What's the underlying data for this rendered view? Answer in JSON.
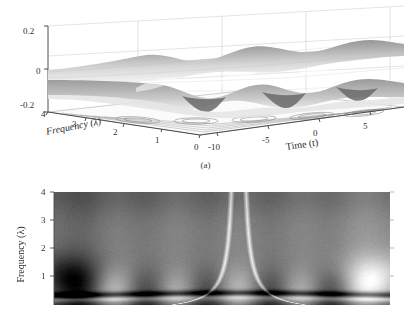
{
  "figure": {
    "background_color": "#ffffff",
    "text_color": "#2b2b2b"
  },
  "panel_a": {
    "subcaption": "(a)",
    "z_axis": {
      "ticks": [
        "0.2",
        "0",
        "-0.2"
      ]
    },
    "frequency_axis": {
      "title": "Frequency (λ)",
      "ticks": [
        "4",
        "3",
        "2",
        "1",
        "0"
      ]
    },
    "time_axis": {
      "title": "Time (t)",
      "ticks": [
        "-10",
        "-5",
        "0",
        "5"
      ]
    }
  },
  "panel_b": {
    "frequency_axis": {
      "title": "Frequency (λ)",
      "ticks": [
        "4",
        "3",
        "2",
        "1"
      ]
    }
  },
  "chart_data": [
    {
      "type": "surface",
      "panel": "(a)",
      "title": "",
      "xlabel": "Time (t)",
      "ylabel": "Frequency (λ)",
      "zlabel": "",
      "xlim": [
        -13,
        7
      ],
      "ylim": [
        0,
        4
      ],
      "zlim": [
        -0.2,
        0.2
      ],
      "xticks": [
        -10,
        -5,
        0,
        5
      ],
      "yticks": [
        0,
        1,
        2,
        3,
        4
      ],
      "zticks": [
        -0.2,
        0,
        0.2
      ],
      "grid": true,
      "colormap": "gray",
      "description": "Wigner-Ville / wavelet time-frequency surface with oscillating ridges along time and a base-plane contour projection",
      "surface_model": {
        "form": "z = A*exp(-((y-y0)^2)/(2*sy^2)) * cos(w*(x-x0)) * exp(-((x-xc)^2)/(2*sx^2)) + ripple",
        "amplitude": 0.15,
        "ridge_frequency_center": 1.0,
        "ridge_sigma_freq": 0.55,
        "oscillation_period_time": 4.0,
        "envelope_center_time": -3.0,
        "envelope_sigma_time": 7.0
      },
      "ridge_peaks_time": [
        -10.0,
        -6.0,
        -2.0,
        2.0,
        6.0
      ],
      "ridge_troughs_time": [
        -12.0,
        -8.0,
        -4.0,
        0.0,
        4.0
      ],
      "view": {
        "azimuth": -37.5,
        "elevation": 18
      }
    },
    {
      "type": "heatmap",
      "panel": "(b)",
      "title": "",
      "xlabel": "",
      "ylabel": "Frequency (λ)",
      "xlim": [
        -13,
        7
      ],
      "ylim": [
        0.3,
        4
      ],
      "yticks": [
        1,
        2,
        3,
        4
      ],
      "grid": false,
      "colormap": "gray",
      "colormap_inverted": false,
      "description": "Grayscale scalogram (time-frequency energy map) showing alternating bright and dark vertical lobes concentrated near frequency 1, with two light cone-of-influence hyperbolae converging near the centre and a dark horizontal ridge near frequency 0.55",
      "bright_lobe_centers_x_frac": [
        0.18,
        0.365,
        0.55,
        0.735,
        0.915
      ],
      "dark_lobe_centers_x_frac": [
        0.085,
        0.275,
        0.455,
        0.645,
        0.825
      ],
      "lobe_center_frequency": 1.15,
      "lobe_sigma_frequency": 0.55,
      "cone_of_influence": {
        "apex_x_frac": 0.55,
        "left_branch_visible": true,
        "right_branch_visible": true,
        "color": "#e8e8e8"
      },
      "low_frequency_ridge": {
        "frequency": 0.58,
        "tone": "dark",
        "curvature": "shallow-arc-peaking-at-centre"
      },
      "value_range": [
        0,
        1
      ]
    }
  ]
}
